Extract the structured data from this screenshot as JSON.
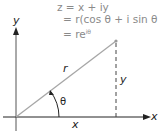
{
  "equations": {
    "line1": "z = x + iy",
    "line2": "= r(cos θ + i sin θ)",
    "line3_base": "= re",
    "line3_exp": "iθ"
  },
  "labels": {
    "y_axis": "y",
    "x_axis": "x",
    "radius": "r",
    "vertical": "y",
    "horizontal": "x",
    "angle": "θ"
  },
  "colors": {
    "axis": "#222222",
    "vector": "#a6a6a6",
    "dashed": "#444444",
    "equation_text": "#8a8a8a"
  },
  "geometry": {
    "origin": [
      16,
      117
    ],
    "point": [
      116,
      41
    ],
    "angle_arc_radius": 43
  }
}
